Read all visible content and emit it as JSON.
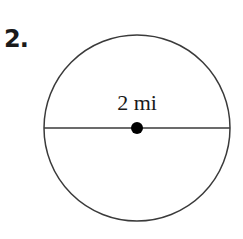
{
  "problem": {
    "number": "2."
  },
  "figure": {
    "shape": "circle",
    "segment": "diameter",
    "center_marked": true,
    "label": "2 mi"
  }
}
